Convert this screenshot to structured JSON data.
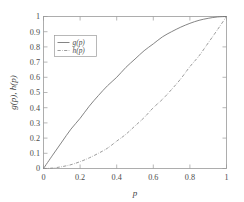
{
  "chart_data": {
    "type": "line",
    "title": "",
    "subtitle": "",
    "xlabel": "p",
    "ylabel": "g(p), h(p)",
    "xlim": [
      0,
      1
    ],
    "ylim": [
      0,
      1
    ],
    "grid": false,
    "legend_position": "upper-left",
    "xticks": [
      "0",
      "0.2",
      "0.4",
      "0.6",
      "0.8",
      "1"
    ],
    "xtick_values": [
      0,
      0.2,
      0.4,
      0.6,
      0.8,
      1
    ],
    "yticks": [
      "0",
      "0.1",
      "0.2",
      "0.3",
      "0.4",
      "0.5",
      "0.6",
      "0.7",
      "0.8",
      "0.9",
      "1"
    ],
    "ytick_values": [
      0,
      0.1,
      0.2,
      0.3,
      0.4,
      0.5,
      0.6,
      0.7,
      0.8,
      0.9,
      1
    ],
    "x": [
      0,
      0.05,
      0.1,
      0.15,
      0.2,
      0.25,
      0.3,
      0.35,
      0.4,
      0.45,
      0.5,
      0.55,
      0.6,
      0.65,
      0.7,
      0.75,
      0.8,
      0.85,
      0.9,
      0.95,
      1
    ],
    "series": [
      {
        "name": "g(p)",
        "style": "solid",
        "color": "#6e6e6e",
        "values": [
          0,
          0.088,
          0.174,
          0.259,
          0.33,
          0.41,
          0.48,
          0.545,
          0.6,
          0.665,
          0.72,
          0.775,
          0.82,
          0.866,
          0.9,
          0.93,
          0.955,
          0.975,
          0.988,
          0.997,
          1
        ]
      },
      {
        "name": "h(p)",
        "style": "dash-dot",
        "color": "#8a8a8a",
        "values": [
          0,
          0.003,
          0.012,
          0.025,
          0.045,
          0.07,
          0.1,
          0.134,
          0.18,
          0.225,
          0.28,
          0.335,
          0.4,
          0.455,
          0.52,
          0.59,
          0.67,
          0.741,
          0.826,
          0.912,
          1
        ]
      }
    ],
    "legend_entries": [
      "g(p)",
      "h(p)"
    ]
  },
  "axes": {
    "x_label": "p",
    "y_label": "g(p), h(p)"
  },
  "colors": {
    "frame": "#9a9a9a",
    "text": "#4d4d4d",
    "curve_g": "#6e6e6e",
    "curve_h": "#8a8a8a",
    "background": "#ffffff"
  }
}
